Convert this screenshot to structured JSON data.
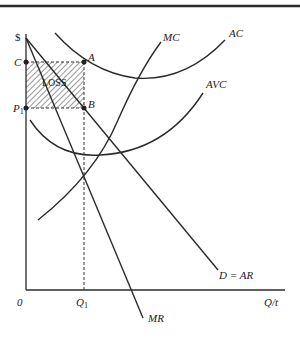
{
  "diagram": {
    "type": "economics-firm-short-run-loss",
    "axes": {
      "y_label": "$",
      "x_label": "Q/t",
      "origin_label": "0"
    },
    "price_labels": {
      "c": "C",
      "p1": "P",
      "p1_sub": "1"
    },
    "quantity_labels": {
      "q1": "Q",
      "q1_sub": "1"
    },
    "points": {
      "a": "A",
      "b": "B"
    },
    "region_label": "LOSS",
    "curves": {
      "mc": "MC",
      "ac": "AC",
      "avc": "AVC",
      "demand": "D = AR",
      "mr": "MR"
    },
    "colors": {
      "ink": "#2b2b2b",
      "background": "#ffffff"
    }
  }
}
